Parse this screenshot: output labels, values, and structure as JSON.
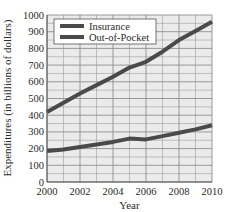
{
  "chart_data": {
    "type": "line",
    "title": "",
    "xlabel": "Year",
    "ylabel": "Expenditures (in billions of dollars)",
    "x": [
      2000,
      2001,
      2002,
      2003,
      2004,
      2005,
      2006,
      2007,
      2008,
      2009,
      2010
    ],
    "series": [
      {
        "name": "Insurance",
        "values": [
          420,
          475,
          530,
          580,
          630,
          685,
          720,
          780,
          850,
          905,
          960
        ]
      },
      {
        "name": "Out-of-Pocket",
        "values": [
          185,
          195,
          210,
          225,
          240,
          260,
          255,
          275,
          295,
          315,
          340
        ]
      }
    ],
    "xlim": [
      2000,
      2010
    ],
    "ylim": [
      0,
      1000
    ],
    "xticks": [
      2000,
      2002,
      2004,
      2006,
      2008,
      2010
    ],
    "yticks": [
      0,
      100,
      200,
      300,
      400,
      500,
      600,
      700,
      800,
      900,
      1000
    ],
    "grid": true,
    "legend_position": "upper left"
  },
  "colors": {
    "line": "#4a4a4a",
    "plot_bg": "#ebebeb",
    "grid": "#8f8f8f"
  },
  "legend": {
    "items": [
      "Insurance",
      "Out-of-Pocket"
    ]
  },
  "axes": {
    "xlabel": "Year",
    "ylabel": "Expenditures (in billions of dollars)"
  }
}
